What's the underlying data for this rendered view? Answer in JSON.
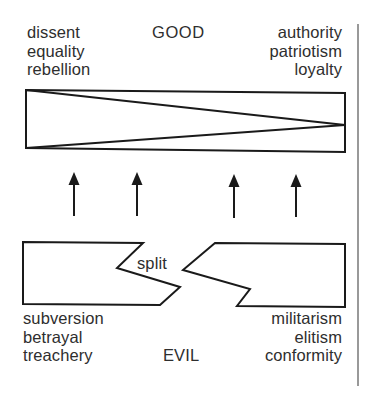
{
  "top": {
    "heading": "GOOD",
    "left_terms": [
      "dissent",
      "equality",
      "rebellion"
    ],
    "right_terms": [
      "authority",
      "patriotism",
      "loyalty"
    ]
  },
  "middle": {
    "arrow_count": 4,
    "arrow_direction": "up"
  },
  "bottom": {
    "heading": "EVIL",
    "split_label": "split",
    "left_terms": [
      "subversion",
      "betrayal",
      "treachery"
    ],
    "right_terms": [
      "militarism",
      "elitism",
      "conformity"
    ]
  },
  "colors": {
    "line": "#1a1a1a",
    "text": "#2e2e2e",
    "background": "#ffffff"
  }
}
